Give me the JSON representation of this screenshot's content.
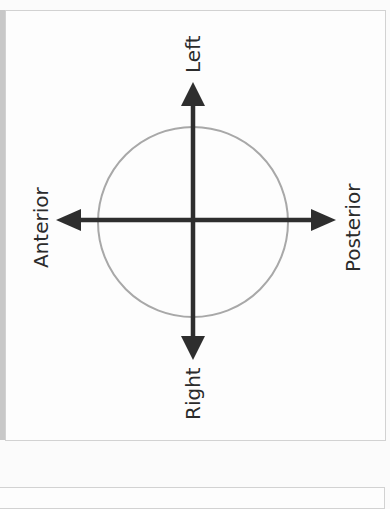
{
  "diagram": {
    "labels": {
      "top": "Left",
      "bottom": "Right",
      "left": "Anterior",
      "right": "Posterior"
    },
    "colors": {
      "arrow": "#2e2e2e",
      "circle": "#a8a8a8",
      "text": "#2b2b2b",
      "panel_border": "#d2d2d2"
    }
  }
}
